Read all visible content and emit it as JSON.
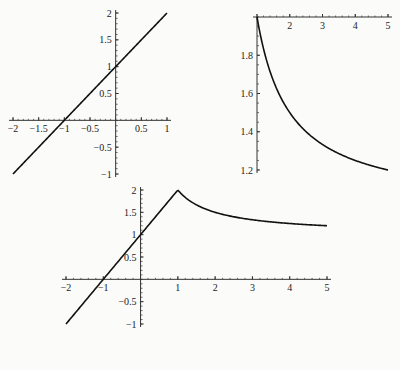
{
  "chart_data": [
    {
      "type": "line",
      "title": "",
      "function": "y = x + 1",
      "x": [
        -2,
        1
      ],
      "y": [
        -1,
        2
      ],
      "xlim": [
        -2,
        1
      ],
      "ylim": [
        -1,
        2
      ],
      "xticks": [
        "-2",
        "-1.5",
        "-1",
        "-0.5",
        "0.5",
        "1"
      ],
      "yticks": [
        "2",
        "1.5",
        "1",
        "0.5",
        "-0.5",
        "-1"
      ],
      "xlabel": "",
      "ylabel": "",
      "grid": false
    },
    {
      "type": "line",
      "title": "",
      "function": "y = 1 + 1/x",
      "x": [
        1,
        1.5,
        2,
        2.5,
        3,
        3.5,
        4,
        4.5,
        5
      ],
      "y": [
        2,
        1.667,
        1.5,
        1.4,
        1.333,
        1.286,
        1.25,
        1.222,
        1.2
      ],
      "xlim": [
        1,
        5
      ],
      "ylim": [
        1.2,
        2
      ],
      "xticks": [
        "2",
        "3",
        "4",
        "5"
      ],
      "yticks": [
        "1.8",
        "1.6",
        "1.4",
        "1.2"
      ],
      "xlabel": "",
      "ylabel": "",
      "grid": false
    },
    {
      "type": "line",
      "title": "",
      "function": "y = x + 1 for x<=1; y = 1 + 1/x for x>1",
      "x": [
        -2,
        -1,
        0,
        1,
        1.5,
        2,
        2.5,
        3,
        3.5,
        4,
        4.5,
        5
      ],
      "y": [
        -1,
        0,
        1,
        2,
        1.667,
        1.5,
        1.4,
        1.333,
        1.286,
        1.25,
        1.222,
        1.2
      ],
      "xlim": [
        -2,
        5
      ],
      "ylim": [
        -1,
        2
      ],
      "xticks": [
        "-2",
        "-1",
        "1",
        "2",
        "3",
        "4",
        "5"
      ],
      "yticks": [
        "2",
        "1.5",
        "1",
        "0.5",
        "-0.5",
        "-1"
      ],
      "xlabel": "",
      "ylabel": "",
      "grid": false
    }
  ],
  "colors": {
    "line": "#111111",
    "axis": "#333333",
    "background": "#fbfbf9"
  }
}
